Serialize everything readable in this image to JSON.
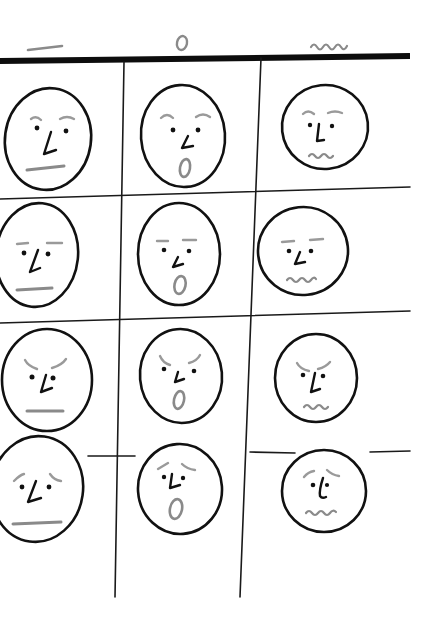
{
  "diagram": {
    "type": "hand-drawn expression grid",
    "column_headers": [
      {
        "symbol": "—",
        "meaning": "flat mouth"
      },
      {
        "symbol": "0",
        "meaning": "open mouth"
      },
      {
        "symbol": "~~~",
        "meaning": "wavy mouth"
      }
    ],
    "row_brows": [
      "raised",
      "flat",
      "angry (furrowed)",
      "worried (slanted up)"
    ],
    "cells": [
      [
        {
          "row": 1,
          "col": 1,
          "brows": "raised",
          "mouth": "flat"
        },
        {
          "row": 1,
          "col": 2,
          "brows": "raised",
          "mouth": "open"
        },
        {
          "row": 1,
          "col": 3,
          "brows": "raised",
          "mouth": "wavy"
        }
      ],
      [
        {
          "row": 2,
          "col": 1,
          "brows": "flat",
          "mouth": "flat"
        },
        {
          "row": 2,
          "col": 2,
          "brows": "flat",
          "mouth": "open"
        },
        {
          "row": 2,
          "col": 3,
          "brows": "flat",
          "mouth": "wavy"
        }
      ],
      [
        {
          "row": 3,
          "col": 1,
          "brows": "angry",
          "mouth": "flat"
        },
        {
          "row": 3,
          "col": 2,
          "brows": "angry",
          "mouth": "open"
        },
        {
          "row": 3,
          "col": 3,
          "brows": "angry",
          "mouth": "wavy"
        }
      ],
      [
        {
          "row": 4,
          "col": 1,
          "brows": "worried",
          "mouth": "flat"
        },
        {
          "row": 4,
          "col": 2,
          "brows": "worried",
          "mouth": "open"
        },
        {
          "row": 4,
          "col": 3,
          "brows": "worried",
          "mouth": "wavy"
        }
      ]
    ],
    "colors": {
      "ink": "#111111",
      "pencil_gray": "#8a8a8a",
      "paper": "#ffffff"
    }
  }
}
